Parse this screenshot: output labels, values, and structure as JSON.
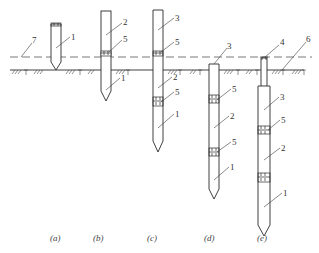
{
  "figure": {
    "captions": [
      "(a)",
      "(b)",
      "(c)",
      "(d)",
      "(e)"
    ],
    "callouts": {
      "water_line": "7",
      "ground_line": "6",
      "pile_section_1": "1",
      "pile_section_2": "2",
      "pile_section_3": "3",
      "follower": "4",
      "joint": "5"
    },
    "stages": [
      {
        "id": "a",
        "caption": "(a)",
        "labels": [
          "7",
          "1"
        ]
      },
      {
        "id": "b",
        "caption": "(b)",
        "labels": [
          "2",
          "5",
          "1"
        ]
      },
      {
        "id": "c",
        "caption": "(c)",
        "labels": [
          "3",
          "5",
          "2",
          "5",
          "1"
        ]
      },
      {
        "id": "d",
        "caption": "(d)",
        "labels": [
          "3",
          "5",
          "2",
          "5",
          "1"
        ]
      },
      {
        "id": "e",
        "caption": "(e)",
        "labels": [
          "4",
          "6",
          "3",
          "5",
          "2",
          "1"
        ]
      }
    ]
  }
}
